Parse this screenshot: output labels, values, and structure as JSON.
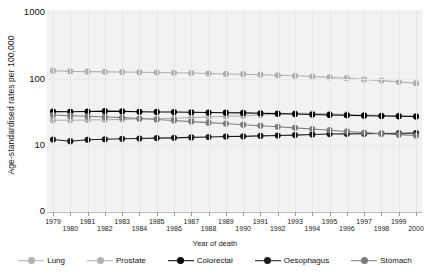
{
  "chart_data": {
    "type": "line",
    "title": "",
    "xlabel": "Year of death",
    "ylabel": "Age-standardised rates per 100,000",
    "yscale": "log",
    "ylim": [
      8,
      1000
    ],
    "ytick_labels": [
      "1000",
      "100",
      "10",
      "0"
    ],
    "grid": true,
    "legend_position": "bottom",
    "x": [
      1979,
      1980,
      1981,
      1982,
      1983,
      1984,
      1985,
      1986,
      1987,
      1988,
      1989,
      1990,
      1991,
      1992,
      1993,
      1994,
      1995,
      1996,
      1997,
      1998,
      1999,
      2000
    ],
    "xtick_labels": [
      "1979",
      "1980",
      "1981",
      "1982",
      "1983",
      "1984",
      "1985",
      "1986",
      "1987",
      "1988",
      "1989",
      "1990",
      "1991",
      "1992",
      "1993",
      "1994",
      "1995",
      "1996",
      "1997",
      "1998",
      "1999",
      "2000"
    ],
    "series": [
      {
        "name": "Lung",
        "color": "#b0b0b0",
        "values": [
          131,
          128,
          127,
          126,
          125,
          124,
          123,
          122,
          121,
          119,
          117,
          116,
          114,
          112,
          110,
          107,
          104,
          101,
          97,
          93,
          89,
          85
        ]
      },
      {
        "name": "Prostate",
        "color": "#b0b0b0",
        "values": [
          23.5,
          23.6,
          23.8,
          24.0,
          24.3,
          24.6,
          25.0,
          25.3,
          25.8,
          26.3,
          27.0,
          27.4,
          28.3,
          29.2,
          30.3,
          30.0,
          29.4,
          28.8,
          28.3,
          27.9,
          27.6,
          27.3
        ]
      },
      {
        "name": "Colorectal",
        "color": "#000000",
        "values": [
          31.8,
          31.6,
          31.9,
          32.3,
          32.0,
          31.6,
          31.4,
          31.3,
          31.1,
          30.8,
          30.6,
          30.4,
          30.0,
          29.6,
          29.2,
          28.7,
          28.3,
          28.0,
          27.6,
          27.3,
          27.0,
          26.8
        ]
      },
      {
        "name": "Oesophagus",
        "color": "#1c1c1c",
        "values": [
          12.1,
          11.4,
          12.0,
          12.2,
          12.4,
          12.5,
          12.7,
          12.8,
          13.0,
          13.2,
          13.4,
          13.5,
          13.7,
          13.9,
          14.1,
          14.4,
          14.6,
          14.7,
          14.8,
          14.9,
          15.0,
          15.1
        ]
      },
      {
        "name": "Stomach",
        "color": "#7d7d7d",
        "values": [
          28.2,
          27.6,
          27.0,
          26.4,
          25.8,
          25.0,
          24.2,
          23.4,
          22.5,
          21.7,
          21.0,
          20.2,
          19.5,
          18.8,
          18.1,
          17.4,
          16.7,
          16.0,
          15.4,
          14.8,
          14.3,
          13.9
        ]
      }
    ]
  },
  "legend": {
    "items": [
      {
        "label": "Lung",
        "color": "#b0b0b0"
      },
      {
        "label": "Prostate",
        "color": "#b0b0b0"
      },
      {
        "label": "Colorectal",
        "color": "#000000"
      },
      {
        "label": "Oesophagus",
        "color": "#1c1c1c"
      },
      {
        "label": "Stomach",
        "color": "#7d7d7d"
      }
    ]
  }
}
